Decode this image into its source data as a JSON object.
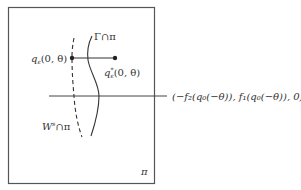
{
  "diagram": {
    "plane_label": "π",
    "gamma_label": "Γ∩π",
    "w_label_base": "W",
    "w_label_sup": "s",
    "w_label_rest": "∩π",
    "q_left_label_base": "q",
    "q_left_label_sub": "ε",
    "q_left_label_args": "(0, θ)",
    "q_right_label_base": "q",
    "q_right_label_sub": "ε",
    "q_right_label_sup": "*",
    "q_right_label_args": "(0, θ)",
    "point_label": "(−f₂(q₀(−θ)), f₁(q₀(−θ)), 0)",
    "colors": {
      "frame": "#555555",
      "line": "#333333",
      "text": "#333333"
    }
  }
}
